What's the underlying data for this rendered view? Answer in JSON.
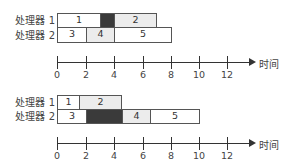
{
  "diagrams": [
    {
      "processors": [
        {
          "label": "处理器 1",
          "tasks": [
            {
              "label": "1",
              "start": 0,
              "end": 3,
              "fill": "white"
            },
            {
              "label": "",
              "start": 3,
              "end": 4,
              "fill": "dark"
            },
            {
              "label": "2",
              "start": 4,
              "end": 7,
              "fill": "gray"
            }
          ]
        },
        {
          "label": "处理器 2",
          "tasks": [
            {
              "label": "3",
              "start": 0,
              "end": 2,
              "fill": "white"
            },
            {
              "label": "4",
              "start": 2,
              "end": 4,
              "fill": "gray"
            },
            {
              "label": "5",
              "start": 4,
              "end": 8,
              "fill": "white"
            }
          ]
        }
      ],
      "axis": {
        "ticks": [
          "0",
          "2",
          "4",
          "6",
          "8",
          "10",
          "12"
        ],
        "title": "时间"
      }
    },
    {
      "processors": [
        {
          "label": "处理器 1",
          "tasks": [
            {
              "label": "1",
              "start": 0,
              "end": 1.5,
              "fill": "white"
            },
            {
              "label": "2",
              "start": 1.5,
              "end": 4.5,
              "fill": "gray"
            }
          ]
        },
        {
          "label": "处理器 2",
          "tasks": [
            {
              "label": "3",
              "start": 0,
              "end": 2,
              "fill": "white"
            },
            {
              "label": "",
              "start": 2,
              "end": 4.5,
              "fill": "dark"
            },
            {
              "label": "4",
              "start": 4.5,
              "end": 6.5,
              "fill": "gray"
            },
            {
              "label": "5",
              "start": 6.5,
              "end": 10,
              "fill": "white"
            }
          ]
        }
      ],
      "axis": {
        "ticks": [
          "0",
          "2",
          "4",
          "6",
          "8",
          "10",
          "12"
        ],
        "title": "时间"
      }
    }
  ],
  "colors": {
    "white": "#ffffff",
    "gray": "#ececec",
    "dark": "#3a3a3a",
    "line": "#333333"
  }
}
